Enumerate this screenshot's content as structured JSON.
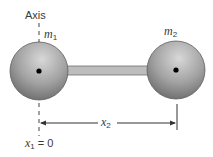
{
  "diagram": {
    "axis_label": "Axis",
    "mass1": {
      "symbol": "m",
      "subscript": "1"
    },
    "mass2": {
      "symbol": "m",
      "subscript": "2"
    },
    "distance_label": {
      "symbol": "x",
      "subscript": "2"
    },
    "origin_label": {
      "symbol": "x",
      "subscript": "1",
      "rest": " = 0"
    },
    "colors": {
      "sphere": "#9a9a9a",
      "sphere_highlight": "#d6d6d6",
      "sphere_shadow": "#6c6c6c",
      "rod": "#b9b9b9",
      "rod_edge": "#6e6e6e",
      "line": "#333333",
      "center_dot": "#000000"
    }
  }
}
